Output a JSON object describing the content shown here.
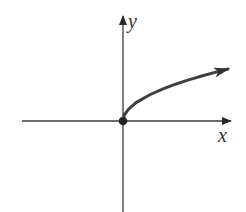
{
  "chart_data": {
    "type": "line",
    "title": "",
    "xlabel": "x",
    "ylabel": "y",
    "function": "y = sqrt(x)",
    "series": [
      {
        "name": "sqrt(x)",
        "start_point": {
          "x": 0,
          "y": 0,
          "marker": "filled-dot"
        },
        "end": "arrow",
        "x": [
          0,
          0.05,
          0.2,
          0.5,
          1,
          1.5,
          2,
          2.5,
          3,
          3.5,
          4
        ],
        "values": [
          0,
          0.224,
          0.447,
          0.707,
          1,
          1.225,
          1.414,
          1.581,
          1.732,
          1.871,
          2
        ]
      }
    ],
    "axes": {
      "x_arrow": true,
      "y_arrow": true,
      "ticks": false,
      "grid": false
    },
    "legend": null
  },
  "labels": {
    "x_axis": "x",
    "y_axis": "y"
  },
  "colors": {
    "curve": "#404040",
    "axis": "#3a3a3a",
    "background": "#ffffff"
  }
}
